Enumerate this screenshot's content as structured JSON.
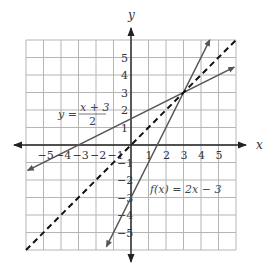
{
  "chart_data": {
    "type": "line",
    "title": "",
    "xlabel": "x",
    "ylabel": "y",
    "xlim": [
      -6,
      6
    ],
    "ylim": [
      -6,
      6
    ],
    "grid": true,
    "x_ticks": [
      -5,
      -4,
      -3,
      -2,
      -1,
      1,
      2,
      3,
      4,
      5
    ],
    "y_ticks": [
      -5,
      -4,
      -3,
      -2,
      -1,
      1,
      2,
      3,
      4,
      5
    ],
    "x_tick_labels": [
      "−5",
      "−4",
      "−3",
      "−2",
      "−1",
      "1",
      "2",
      "3",
      "4",
      "5"
    ],
    "y_tick_labels": [
      "−5",
      "−4",
      "−3",
      "−2",
      "−1",
      "1",
      "2",
      "3",
      "4",
      "5"
    ],
    "series": [
      {
        "name": "f(x) = 2x − 3",
        "equation": "y = 2x - 3",
        "style": "solid",
        "color": "#555555",
        "arrows": "both",
        "x": [
          -1.4,
          4.5
        ],
        "y": [
          -5.8,
          6.0
        ]
      },
      {
        "name": "y = (x + 3)/2",
        "equation": "y = (x + 3) / 2",
        "style": "solid",
        "color": "#555555",
        "arrows": "both",
        "x": [
          -5.9,
          5.9
        ],
        "y": [
          -1.45,
          4.45
        ]
      },
      {
        "name": "y = x",
        "equation": "y = x",
        "style": "dashed",
        "color": "#111111",
        "arrows": "none",
        "x": [
          -6,
          6
        ],
        "y": [
          -6,
          6
        ]
      }
    ],
    "intersection": {
      "x": 3,
      "y": 3
    },
    "annotations": [
      {
        "text": "y = (x + 3)/2",
        "near": [
          -4.2,
          1.8
        ]
      },
      {
        "text": "f(x) = 2x − 3",
        "near": [
          2.5,
          -1.6
        ]
      }
    ]
  },
  "labels": {
    "x_axis": "x",
    "y_axis": "y",
    "eq1_lhs": "y =",
    "eq1_num": "x + 3",
    "eq1_den": "2",
    "eq2": "f(x) = 2x − 3"
  }
}
